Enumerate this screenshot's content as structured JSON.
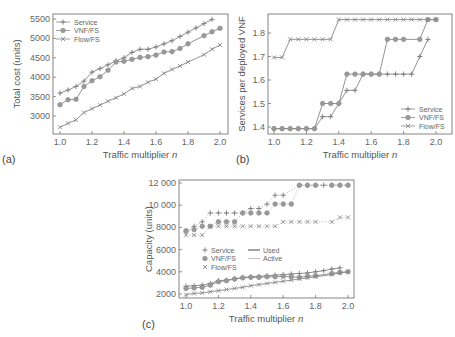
{
  "chart_data": [
    {
      "panel": "(a)",
      "type": "line",
      "title": "",
      "xlabel": "Traffic multiplier n",
      "ylabel": "Total cost (units)",
      "xlim": [
        0.96,
        2.04
      ],
      "ylim": [
        2550,
        5700
      ],
      "xticks": [
        "1.0",
        "1.2",
        "1.4",
        "1.6",
        "1.8",
        "2.0"
      ],
      "yticks": [
        "3000",
        "3500",
        "4000",
        "4500",
        "5000",
        "5500"
      ],
      "grid": false,
      "legend_position": "upper left",
      "series": [
        {
          "name": "Service",
          "marker": "plus",
          "x": [
            1.0,
            1.05,
            1.1,
            1.15,
            1.2,
            1.25,
            1.3,
            1.35,
            1.4,
            1.45,
            1.5,
            1.55,
            1.6,
            1.65,
            1.7,
            1.75,
            1.8,
            1.85,
            1.9,
            1.95
          ],
          "values": [
            3590,
            3670,
            3760,
            3900,
            4130,
            4220,
            4320,
            4420,
            4500,
            4640,
            4720,
            4720,
            4780,
            4860,
            4940,
            5050,
            5160,
            5270,
            5380,
            5490
          ]
        },
        {
          "name": "VNF/FS",
          "marker": "circle",
          "x": [
            1.0,
            1.05,
            1.1,
            1.15,
            1.2,
            1.25,
            1.3,
            1.35,
            1.4,
            1.45,
            1.5,
            1.55,
            1.6,
            1.65,
            1.7,
            1.75,
            1.8,
            1.9,
            1.95,
            2.0
          ],
          "values": [
            3290,
            3420,
            3430,
            3760,
            3910,
            4010,
            4180,
            4390,
            4410,
            4460,
            4510,
            4530,
            4570,
            4650,
            4660,
            4740,
            4860,
            5070,
            5170,
            5260
          ]
        },
        {
          "name": "Flow/FS",
          "marker": "x",
          "x": [
            1.0,
            1.05,
            1.1,
            1.15,
            1.2,
            1.25,
            1.3,
            1.35,
            1.4,
            1.45,
            1.5,
            1.55,
            1.6,
            1.65,
            1.7,
            1.75,
            1.8,
            1.9,
            1.95,
            2.0
          ],
          "values": [
            2710,
            2810,
            2900,
            3090,
            3190,
            3280,
            3380,
            3470,
            3570,
            3710,
            3760,
            3870,
            3950,
            4100,
            4200,
            4290,
            4390,
            4580,
            4720,
            4830
          ]
        }
      ]
    },
    {
      "panel": "(b)",
      "type": "line",
      "title": "",
      "xlabel": "Traffic multiplier n",
      "ylabel": "Services per deployed VNF",
      "xlim": [
        0.96,
        2.04
      ],
      "ylim": [
        1.37,
        1.88
      ],
      "xticks": [
        "1.0",
        "1.2",
        "1.4",
        "1.6",
        "1.8",
        "2.0"
      ],
      "yticks": [
        "1.4",
        "1.5",
        "1.6",
        "1.7",
        "1.8"
      ],
      "grid": false,
      "legend_position": "lower right",
      "series": [
        {
          "name": "Service",
          "marker": "plus",
          "x": [
            1.0,
            1.05,
            1.1,
            1.15,
            1.2,
            1.25,
            1.3,
            1.35,
            1.4,
            1.45,
            1.5,
            1.55,
            1.6,
            1.65,
            1.7,
            1.75,
            1.8,
            1.85,
            1.9,
            1.95
          ],
          "values": [
            1.393,
            1.393,
            1.393,
            1.393,
            1.393,
            1.393,
            1.444,
            1.444,
            1.5,
            1.556,
            1.556,
            1.625,
            1.625,
            1.625,
            1.625,
            1.625,
            1.625,
            1.625,
            1.7,
            1.773
          ]
        },
        {
          "name": "VNF/FS",
          "marker": "circle",
          "x": [
            1.0,
            1.05,
            1.1,
            1.15,
            1.2,
            1.25,
            1.3,
            1.35,
            1.4,
            1.45,
            1.5,
            1.55,
            1.6,
            1.65,
            1.7,
            1.75,
            1.8,
            1.9,
            1.95,
            2.0
          ],
          "values": [
            1.393,
            1.393,
            1.393,
            1.393,
            1.393,
            1.393,
            1.5,
            1.5,
            1.5,
            1.625,
            1.625,
            1.625,
            1.625,
            1.625,
            1.773,
            1.773,
            1.773,
            1.773,
            1.857,
            1.857
          ]
        },
        {
          "name": "Flow/FS",
          "marker": "x",
          "x": [
            1.0,
            1.05,
            1.1,
            1.15,
            1.2,
            1.25,
            1.3,
            1.35,
            1.4,
            1.45,
            1.5,
            1.55,
            1.6,
            1.65,
            1.7,
            1.75,
            1.8,
            1.85,
            1.9,
            1.95,
            2.0
          ],
          "values": [
            1.696,
            1.696,
            1.773,
            1.773,
            1.773,
            1.773,
            1.773,
            1.773,
            1.857,
            1.857,
            1.857,
            1.857,
            1.857,
            1.857,
            1.857,
            1.857,
            1.857,
            1.857,
            1.857,
            1.857,
            1.857
          ]
        }
      ]
    },
    {
      "panel": "(c)",
      "type": "line",
      "title": "",
      "xlabel": "Traffic multiplier n",
      "ylabel": "Capacity (units)",
      "xlim": [
        0.96,
        2.04
      ],
      "ylim": [
        1500,
        12400
      ],
      "xticks": [
        "1.0",
        "1.2",
        "1.4",
        "1.6",
        "1.8",
        "2.0"
      ],
      "yticks": [
        "2000",
        "4000",
        "6000",
        "8000",
        "10 000",
        "12 000"
      ],
      "grid": false,
      "legend_position": "center left",
      "legend": [
        "Service",
        "VNF/FS",
        "Flow/FS",
        "Used",
        "Active"
      ],
      "series": [
        {
          "name": "Service (Active)",
          "marker": "plus",
          "line": "dotted",
          "x": [
            1.0,
            1.05,
            1.1,
            1.15,
            1.2,
            1.25,
            1.3,
            1.35,
            1.4,
            1.45,
            1.5,
            1.55,
            1.6,
            1.7,
            1.75,
            1.8,
            1.85,
            1.9,
            1.95,
            2.0
          ],
          "values": [
            7600,
            8100,
            8500,
            9300,
            9300,
            9300,
            9300,
            9300,
            9700,
            9700,
            10100,
            10900,
            10900,
            11800,
            11800,
            11800,
            11800,
            11800,
            11800,
            11800
          ]
        },
        {
          "name": "VNF/FS (Active)",
          "marker": "circle",
          "line": "dotted",
          "x": [
            1.0,
            1.05,
            1.1,
            1.15,
            1.2,
            1.25,
            1.3,
            1.35,
            1.4,
            1.45,
            1.5,
            1.55,
            1.6,
            1.65,
            1.7,
            1.75,
            1.8,
            1.9,
            1.95,
            2.0
          ],
          "values": [
            7700,
            7800,
            8100,
            8100,
            8500,
            8500,
            8500,
            9300,
            9300,
            9300,
            9300,
            10100,
            10100,
            10100,
            11800,
            11800,
            11800,
            11800,
            11800,
            11800
          ]
        },
        {
          "name": "Flow/FS (Active)",
          "marker": "x",
          "line": "dotted",
          "x": [
            1.0,
            1.05,
            1.1,
            1.15,
            1.2,
            1.25,
            1.3,
            1.35,
            1.4,
            1.45,
            1.5,
            1.55,
            1.6,
            1.65,
            1.7,
            1.75,
            1.8,
            1.9,
            1.95,
            2.0
          ],
          "values": [
            7300,
            7300,
            7300,
            8100,
            8100,
            8100,
            8100,
            8100,
            8100,
            8100,
            8100,
            8100,
            8500,
            8500,
            8500,
            8500,
            8500,
            8500,
            8900,
            8900
          ]
        },
        {
          "name": "Service (Used)",
          "marker": "plus",
          "line": "solid",
          "x": [
            1.0,
            1.05,
            1.1,
            1.15,
            1.2,
            1.25,
            1.3,
            1.35,
            1.4,
            1.45,
            1.5,
            1.55,
            1.6,
            1.65,
            1.7,
            1.75,
            1.8,
            1.85,
            1.9,
            1.95
          ],
          "values": [
            2700,
            2750,
            2800,
            2950,
            3200,
            3250,
            3350,
            3500,
            3550,
            3600,
            3650,
            3700,
            3750,
            3800,
            3850,
            3900,
            4000,
            4100,
            4250,
            4350
          ]
        },
        {
          "name": "VNF/FS (Used)",
          "marker": "circle",
          "line": "solid",
          "x": [
            1.0,
            1.05,
            1.1,
            1.15,
            1.2,
            1.25,
            1.3,
            1.35,
            1.4,
            1.45,
            1.5,
            1.55,
            1.6,
            1.65,
            1.7,
            1.75,
            1.8,
            1.9,
            1.95,
            2.0
          ],
          "values": [
            2500,
            2550,
            2600,
            2800,
            3100,
            3200,
            3350,
            3450,
            3500,
            3500,
            3550,
            3550,
            3600,
            3550,
            3500,
            3600,
            3650,
            3850,
            3950,
            4000
          ]
        },
        {
          "name": "Flow/FS (Used)",
          "marker": "x",
          "line": "solid",
          "x": [
            1.0,
            1.05,
            1.1,
            1.15,
            1.2,
            1.25,
            1.3,
            1.35,
            1.4,
            1.45,
            1.5,
            1.55,
            1.6,
            1.65,
            1.7,
            1.75,
            1.8,
            1.9,
            1.95,
            2.0
          ],
          "values": [
            1950,
            2050,
            2100,
            2200,
            2300,
            2400,
            2500,
            2600,
            2750,
            2850,
            2950,
            3050,
            3150,
            3250,
            3350,
            3450,
            3550,
            3750,
            3900,
            4000
          ]
        }
      ]
    }
  ],
  "panels": {
    "a": {
      "label": "(a)",
      "xlabel": "Traffic multiplier n",
      "ylabel": "Total cost (units)",
      "legend": [
        "Service",
        "VNF/FS",
        "Flow/FS"
      ]
    },
    "b": {
      "label": "(b)",
      "xlabel": "Traffic multiplier n",
      "ylabel": "Services per deployed VNF",
      "legend": [
        "Service",
        "VNF/FS",
        "Flow/FS"
      ]
    },
    "c": {
      "label": "(c)",
      "xlabel": "Traffic multiplier n",
      "ylabel": "Capacity (units)",
      "legend": [
        "Service",
        "VNF/FS",
        "Flow/FS"
      ],
      "legend_lines": [
        "Used",
        "Active"
      ]
    }
  },
  "colors": {
    "axis": "#666666",
    "line": "#888888",
    "text": "#555555"
  }
}
